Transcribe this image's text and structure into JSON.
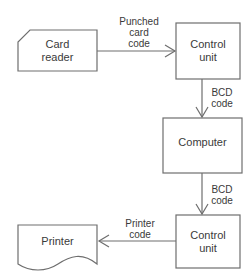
{
  "nodes": {
    "card_reader": {
      "label_line1": "Card",
      "label_line2": "reader",
      "shape": "punched-card"
    },
    "control_unit_1": {
      "label_line1": "Control",
      "label_line2": "unit",
      "shape": "rectangle"
    },
    "computer": {
      "label": "Computer",
      "shape": "rectangle"
    },
    "control_unit_2": {
      "label_line1": "Control",
      "label_line2": "unit",
      "shape": "rectangle"
    },
    "printer": {
      "label": "Printer",
      "shape": "document"
    }
  },
  "edges": [
    {
      "from": "card_reader",
      "to": "control_unit_1",
      "label_line1": "Punched",
      "label_line2": "card",
      "label_line3": "code"
    },
    {
      "from": "control_unit_1",
      "to": "computer",
      "label_line1": "BCD",
      "label_line2": "code"
    },
    {
      "from": "computer",
      "to": "control_unit_2",
      "label_line1": "BCD",
      "label_line2": "code"
    },
    {
      "from": "control_unit_2",
      "to": "printer",
      "label_line1": "Printer",
      "label_line2": "code"
    }
  ],
  "colors": {
    "stroke": "#6e6e6e",
    "text": "#3a3a3a",
    "background": "#ffffff"
  }
}
